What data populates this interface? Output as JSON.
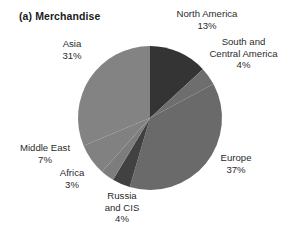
{
  "chart_data": {
    "type": "pie",
    "title": "(a) Merchandise",
    "xlabel": "",
    "ylabel": "",
    "legend_position": "none",
    "grid": false,
    "start_angle_deg": 0,
    "direction": "clockwise",
    "units": "percent",
    "categories": [
      "North America",
      "South and Central America",
      "Europe",
      "Russia and CIS",
      "Africa",
      "Middle East",
      "Asia"
    ],
    "values": [
      13,
      4,
      37,
      4,
      3,
      7,
      31
    ],
    "slices": [
      {
        "name": "North America",
        "label_line1": "North America",
        "label_line2": "13%",
        "value": 13,
        "color": "#343434"
      },
      {
        "name": "South and Central America",
        "label_line1": "South and",
        "label_line2": "Central America",
        "label_line3": "4%",
        "value": 4,
        "color": "#6e6e6e"
      },
      {
        "name": "Europe",
        "label_line1": "Europe",
        "label_line2": "37%",
        "value": 37,
        "color": "#6a6a6a"
      },
      {
        "name": "Russia and CIS",
        "label_line1": "Russia",
        "label_line2": "and CIS",
        "label_line3": "4%",
        "value": 4,
        "color": "#414141"
      },
      {
        "name": "Africa",
        "label_line1": "Africa",
        "label_line2": "3%",
        "value": 3,
        "color": "#7d7d7d"
      },
      {
        "name": "Middle East",
        "label_line1": "Middle East",
        "label_line2": "7%",
        "value": 7,
        "color": "#818181"
      },
      {
        "name": "Asia",
        "label_line1": "Asia",
        "label_line2": "31%",
        "value": 31,
        "color": "#838383"
      }
    ]
  },
  "labels": {
    "north_america": {
      "name": "North America",
      "value": "13%"
    },
    "south_central_america": {
      "line1": "South and",
      "line2": "Central America",
      "value": "4%"
    },
    "europe": {
      "name": "Europe",
      "value": "37%"
    },
    "russia_cis": {
      "line1": "Russia",
      "line2": "and CIS",
      "value": "4%"
    },
    "africa": {
      "name": "Africa",
      "value": "3%"
    },
    "middle_east": {
      "name": "Middle East",
      "value": "7%"
    },
    "asia": {
      "name": "Asia",
      "value": "31%"
    }
  },
  "geometry": {
    "center_x": 150,
    "center_y": 118,
    "radius": 72
  }
}
